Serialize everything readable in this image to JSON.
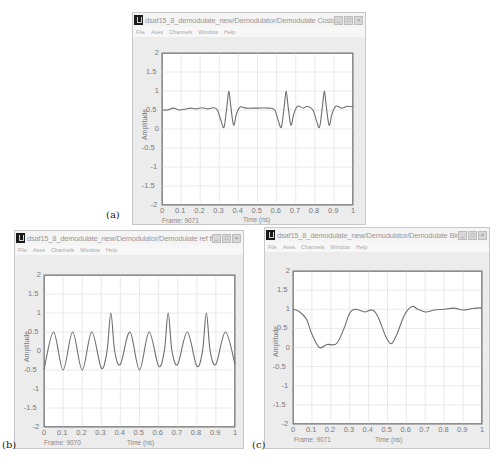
{
  "captions": [
    "(a)",
    "(b)",
    "(c)"
  ],
  "menu": [
    "File",
    "Axes",
    "Channels",
    "Window",
    "Help"
  ],
  "window_buttons": {
    "minimize": "_",
    "maximize": "□",
    "close": "×"
  },
  "windows": [
    {
      "id": "a",
      "title": "dsaf15_8_demodulate_new/Demodulator/Demodulate Costas Sc...",
      "frame_label": "Frame: 9071",
      "xlabel": "Time (ns)",
      "ylabel": "Amplitude"
    },
    {
      "id": "b",
      "title": "dsaf15_8_demodulate_new/Demodulator/Demodulate ref filter ...",
      "frame_label": "Frame: 9070",
      "xlabel": "Time (ns)",
      "ylabel": "Amplitude"
    },
    {
      "id": "c",
      "title": "dsaf15_8_demodulate_new/Demodulator/Demodulate Binary Scope",
      "frame_label": "Frame: 9071",
      "xlabel": "Time (ns)",
      "ylabel": "Amplitude"
    }
  ],
  "axes": {
    "xticks": [
      "0",
      "0.1",
      "0.2",
      "0.3",
      "0.4",
      "0.5",
      "0.6",
      "0.7",
      "0.8",
      "0.9",
      "1"
    ],
    "yticks": [
      "2",
      "1.5",
      "1",
      "0.5",
      "0",
      "-0.5",
      "-1",
      "-1.5",
      "-2"
    ]
  },
  "colors": {
    "trace": "#6e6e6e",
    "grid": "#e4e4e4",
    "window_bg": "#ececec",
    "plot_bg": "#ffffff"
  },
  "chart_data": [
    {
      "type": "line",
      "title": "Demodulate Costas Scope",
      "xlabel": "Time (ns)",
      "ylabel": "Amplitude",
      "xlim": [
        0,
        1
      ],
      "ylim": [
        -2,
        2
      ],
      "grid": true,
      "x": [
        0,
        0.03,
        0.06,
        0.09,
        0.12,
        0.15,
        0.18,
        0.21,
        0.24,
        0.27,
        0.29,
        0.31,
        0.325,
        0.34,
        0.35,
        0.36,
        0.375,
        0.39,
        0.41,
        0.44,
        0.5,
        0.56,
        0.59,
        0.61,
        0.625,
        0.64,
        0.65,
        0.66,
        0.675,
        0.69,
        0.71,
        0.74,
        0.76,
        0.79,
        0.81,
        0.825,
        0.84,
        0.85,
        0.86,
        0.875,
        0.89,
        0.91,
        0.94,
        0.97,
        1.0
      ],
      "y": [
        0.5,
        0.5,
        0.55,
        0.5,
        0.52,
        0.55,
        0.53,
        0.56,
        0.53,
        0.56,
        0.5,
        0.2,
        0.05,
        0.6,
        1.0,
        0.6,
        0.1,
        0.4,
        0.58,
        0.55,
        0.55,
        0.55,
        0.5,
        0.2,
        0.05,
        0.6,
        1.0,
        0.6,
        0.1,
        0.4,
        0.6,
        0.55,
        0.6,
        0.5,
        0.2,
        0.05,
        0.6,
        1.0,
        0.6,
        0.1,
        0.4,
        0.6,
        0.55,
        0.6,
        0.58
      ]
    },
    {
      "type": "line",
      "title": "Demodulate ref filter",
      "xlabel": "Time (ns)",
      "ylabel": "Amplitude",
      "xlim": [
        0,
        1
      ],
      "ylim": [
        -2,
        2
      ],
      "grid": true,
      "x": [
        0,
        0.05,
        0.1,
        0.15,
        0.2,
        0.25,
        0.3,
        0.33,
        0.35,
        0.37,
        0.4,
        0.45,
        0.5,
        0.55,
        0.6,
        0.63,
        0.65,
        0.67,
        0.7,
        0.75,
        0.8,
        0.83,
        0.85,
        0.87,
        0.9,
        0.95,
        1.0
      ],
      "y": [
        -0.5,
        0.5,
        -0.5,
        0.5,
        -0.5,
        0.5,
        -0.45,
        0.0,
        1.0,
        0.0,
        -0.35,
        0.5,
        -0.5,
        0.5,
        -0.4,
        0.0,
        1.0,
        0.0,
        -0.35,
        0.5,
        -0.4,
        0.0,
        1.0,
        0.0,
        -0.35,
        0.5,
        -0.35
      ]
    },
    {
      "type": "line",
      "title": "Demodulate Binary Scope",
      "xlabel": "Time (ns)",
      "ylabel": "Amplitude",
      "xlim": [
        0,
        1
      ],
      "ylim": [
        -2,
        2
      ],
      "grid": true,
      "x": [
        0,
        0.03,
        0.07,
        0.1,
        0.14,
        0.18,
        0.23,
        0.27,
        0.3,
        0.33,
        0.38,
        0.42,
        0.45,
        0.49,
        0.52,
        0.55,
        0.59,
        0.63,
        0.66,
        0.7,
        0.75,
        0.8,
        0.85,
        0.9,
        0.95,
        1.0
      ],
      "y": [
        1.0,
        0.95,
        0.75,
        0.35,
        0.0,
        0.08,
        0.1,
        0.5,
        0.9,
        1.0,
        0.93,
        0.98,
        0.8,
        0.3,
        0.1,
        0.35,
        0.85,
        1.07,
        1.0,
        0.93,
        0.98,
        1.0,
        1.03,
        0.98,
        1.02,
        1.04
      ]
    }
  ]
}
